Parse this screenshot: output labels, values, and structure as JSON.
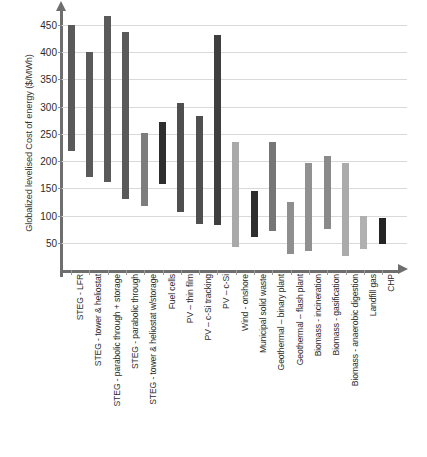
{
  "chart_data": {
    "type": "bar",
    "variant": "floating-range-bar",
    "title": "",
    "xlabel": "",
    "ylabel": "Globalized levelised Cost of energy ($/MWh)",
    "ylim": [
      0,
      470
    ],
    "yticks": [
      50,
      100,
      150,
      200,
      250,
      300,
      350,
      400,
      450
    ],
    "ytick_labels": [
      "50",
      "100",
      "150",
      "200",
      "250",
      "300",
      "350",
      "400",
      "450"
    ],
    "grid": true,
    "legend": "none",
    "categories": [
      "STEG - LFR",
      "STEG - tower & heliostat",
      "STEG - parabolic through + storage",
      "STEG - parabolic through",
      "STEG - tower & heliostat w/storage",
      "Fuel cells",
      "PV – thin film",
      "PV – c-Si tracking",
      "PV – c-Si",
      "Wind - onshore",
      "Municipal solid waste",
      "Geothermal – binary plant",
      "Geothermal – flash plant",
      "Biomass - incineration",
      "Biomass - gasification",
      "Biomass - anaerobic digestion",
      "Landfill gas",
      "CHP"
    ],
    "series": [
      {
        "name": "low",
        "values": [
          218,
          170,
          162,
          130,
          118,
          158,
          107,
          85,
          82,
          42,
          60,
          72,
          30,
          35,
          75,
          25,
          38,
          48
        ]
      },
      {
        "name": "high",
        "values": [
          450,
          400,
          467,
          437,
          252,
          272,
          307,
          283,
          432,
          235,
          145,
          235,
          125,
          197,
          210,
          197,
          100,
          95
        ]
      }
    ],
    "bar_colors": [
      "#5a5a5a",
      "#5a5a5a",
      "#5a5a5a",
      "#5a5a5a",
      "#7d7d7d",
      "#2e2e2e",
      "#4f4f4f",
      "#4f4f4f",
      "#3f3f3f",
      "#a9a9a9",
      "#2e2e2e",
      "#767676",
      "#8f8f8f",
      "#919191",
      "#8a8a8a",
      "#ababab",
      "#b0b0b0",
      "#242424"
    ],
    "axis_color": "#6e6e6e",
    "grid_color": "#d9d9d9"
  }
}
